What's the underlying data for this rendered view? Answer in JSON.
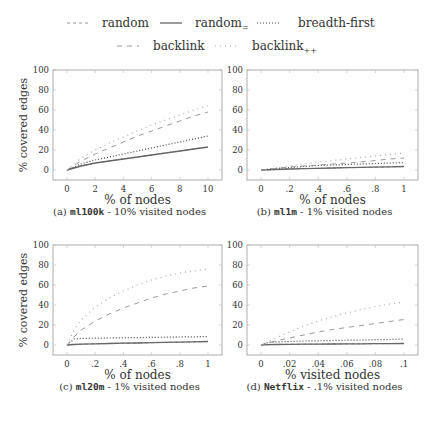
{
  "legend": {
    "items": [
      {
        "key": "random",
        "label": "random",
        "sub": "",
        "dash": "3,3",
        "color": "#888888",
        "width": 0.9
      },
      {
        "key": "random_eq",
        "label": "random",
        "sub": "=",
        "dash": "",
        "color": "#666666",
        "width": 1.3
      },
      {
        "key": "bfs",
        "label": "breadth-first",
        "sub": "",
        "dash": "1,2",
        "color": "#444444",
        "width": 1.2
      },
      {
        "key": "backlink",
        "label": "backlink",
        "sub": "",
        "dash": "5,5",
        "color": "#999999",
        "width": 1.0
      },
      {
        "key": "backlink_pp",
        "label": "backlink",
        "sub": "++",
        "dash": "1,4",
        "color": "#aaaaaa",
        "width": 1.2
      }
    ]
  },
  "chart_data": [
    {
      "type": "line",
      "id": "a",
      "caption_prefix": "(a)",
      "caption_dataset": "ml100k",
      "caption_suffix": " - 10% visited nodes",
      "xlabel": "% of nodes",
      "ylabel": "% covered edges",
      "xlim": [
        0,
        10
      ],
      "ylim": [
        -10,
        100
      ],
      "xticks": [
        0,
        2,
        4,
        6,
        8,
        10
      ],
      "xtick_labels": [
        "0",
        "2",
        "4",
        "6",
        "8",
        "10"
      ],
      "yticks": [
        0,
        20,
        40,
        60,
        80,
        100
      ],
      "x": [
        0,
        1,
        2,
        3,
        4,
        5,
        6,
        7,
        8,
        9,
        10
      ],
      "series": [
        {
          "name": "random",
          "values": [
            0,
            4,
            7,
            9,
            11,
            13,
            15,
            17,
            19,
            21,
            23
          ]
        },
        {
          "name": "random=",
          "values": [
            0,
            4,
            7,
            9,
            11,
            13,
            15,
            17,
            19,
            21,
            23
          ]
        },
        {
          "name": "breadth-first",
          "values": [
            0,
            6,
            10,
            13,
            16,
            19,
            22,
            25,
            28,
            31,
            34
          ]
        },
        {
          "name": "backlink",
          "values": [
            0,
            9,
            16,
            22,
            28,
            34,
            39,
            44,
            49,
            54,
            58
          ]
        },
        {
          "name": "backlink++",
          "values": [
            0,
            12,
            20,
            27,
            33,
            39,
            45,
            50,
            55,
            60,
            64
          ]
        }
      ]
    },
    {
      "type": "line",
      "id": "b",
      "caption_prefix": "(b)",
      "caption_dataset": "ml1m",
      "caption_suffix": " - 1% visited nodes",
      "xlabel": "% of nodes",
      "ylabel": "",
      "xlim": [
        0,
        1
      ],
      "ylim": [
        -10,
        100
      ],
      "xticks": [
        0,
        0.2,
        0.4,
        0.6,
        0.8,
        1
      ],
      "xtick_labels": [
        "0",
        ".2",
        ".4",
        ".6",
        ".8",
        "1"
      ],
      "yticks": [
        0,
        20,
        40,
        60,
        80,
        100
      ],
      "x": [
        0,
        0.1,
        0.2,
        0.3,
        0.4,
        0.5,
        0.6,
        0.7,
        0.8,
        0.9,
        1
      ],
      "series": [
        {
          "name": "random",
          "values": [
            0,
            0.5,
            1,
            1.3,
            1.7,
            2,
            2.3,
            2.6,
            2.9,
            3.2,
            3.5
          ]
        },
        {
          "name": "random=",
          "values": [
            0,
            0.5,
            1,
            1.3,
            1.7,
            2,
            2.3,
            2.6,
            2.9,
            3.2,
            3.5
          ]
        },
        {
          "name": "breadth-first",
          "values": [
            0,
            1.5,
            2.5,
            3.5,
            4.5,
            5,
            5.5,
            6,
            6.5,
            7,
            7.5
          ]
        },
        {
          "name": "backlink",
          "values": [
            0,
            1.5,
            3,
            4,
            5,
            6,
            7,
            8,
            9.5,
            11,
            12
          ]
        },
        {
          "name": "backlink++",
          "values": [
            0,
            2,
            4,
            6,
            8,
            9.5,
            11,
            12.5,
            14,
            15.5,
            17
          ]
        }
      ]
    },
    {
      "type": "line",
      "id": "c",
      "caption_prefix": "(c)",
      "caption_dataset": "ml20m",
      "caption_suffix": " - 1% visited nodes",
      "xlabel": "% of nodes",
      "ylabel": "% covered edges",
      "xlim": [
        0,
        1
      ],
      "ylim": [
        -10,
        100
      ],
      "xticks": [
        0,
        0.2,
        0.4,
        0.6,
        0.8,
        1
      ],
      "xtick_labels": [
        "0",
        ".2",
        ".4",
        ".6",
        ".8",
        "1"
      ],
      "yticks": [
        0,
        20,
        40,
        60,
        80,
        100
      ],
      "x": [
        0,
        0.05,
        0.1,
        0.2,
        0.3,
        0.4,
        0.5,
        0.6,
        0.7,
        0.8,
        0.9,
        1
      ],
      "series": [
        {
          "name": "random",
          "values": [
            0,
            0.5,
            0.8,
            1.2,
            1.5,
            1.8,
            2,
            2.3,
            2.6,
            2.9,
            3.2,
            3.5
          ]
        },
        {
          "name": "random=",
          "values": [
            0,
            0.5,
            0.8,
            1.2,
            1.5,
            1.8,
            2,
            2.3,
            2.6,
            2.9,
            3.2,
            3.5
          ]
        },
        {
          "name": "breadth-first",
          "values": [
            0,
            6,
            6.5,
            6.8,
            7,
            7.2,
            7.4,
            7.6,
            7.8,
            8,
            8.2,
            8.5
          ]
        },
        {
          "name": "backlink",
          "values": [
            0,
            8,
            15,
            24,
            31,
            37,
            42,
            47,
            51,
            54,
            57,
            59
          ]
        },
        {
          "name": "backlink++",
          "values": [
            0,
            15,
            25,
            38,
            47,
            54,
            60,
            65,
            69,
            72,
            74,
            76
          ]
        }
      ]
    },
    {
      "type": "line",
      "id": "d",
      "caption_prefix": "(d)",
      "caption_dataset": "Netflix",
      "caption_suffix": " - .1% visited nodes",
      "xlabel": "% visited nodes",
      "ylabel": "",
      "xlim": [
        0,
        0.1
      ],
      "ylim": [
        -10,
        100
      ],
      "xticks": [
        0,
        0.02,
        0.04,
        0.06,
        0.08,
        0.1
      ],
      "xtick_labels": [
        "0",
        ".02",
        ".04",
        ".06",
        ".08",
        ".1"
      ],
      "yticks": [
        0,
        20,
        40,
        60,
        80,
        100
      ],
      "x": [
        0,
        0.005,
        0.01,
        0.02,
        0.03,
        0.04,
        0.05,
        0.06,
        0.07,
        0.08,
        0.09,
        0.1
      ],
      "series": [
        {
          "name": "random",
          "values": [
            0,
            0.3,
            0.5,
            0.7,
            0.8,
            0.9,
            1,
            1.1,
            1.2,
            1.3,
            1.4,
            1.5
          ]
        },
        {
          "name": "random=",
          "values": [
            0,
            0.3,
            0.5,
            0.7,
            0.8,
            0.9,
            1,
            1.1,
            1.2,
            1.3,
            1.4,
            1.5
          ]
        },
        {
          "name": "breadth-first",
          "values": [
            0,
            2.5,
            3,
            3.5,
            4,
            4.2,
            4.5,
            4.8,
            5,
            5.3,
            5.5,
            6
          ]
        },
        {
          "name": "backlink",
          "values": [
            0,
            2,
            4,
            7,
            10,
            13,
            15.5,
            17.5,
            19.5,
            21.5,
            23.5,
            25.5
          ]
        },
        {
          "name": "backlink++",
          "values": [
            0,
            3,
            7,
            13,
            19,
            24,
            28.5,
            32,
            35.5,
            38.5,
            41,
            43
          ]
        }
      ]
    }
  ]
}
